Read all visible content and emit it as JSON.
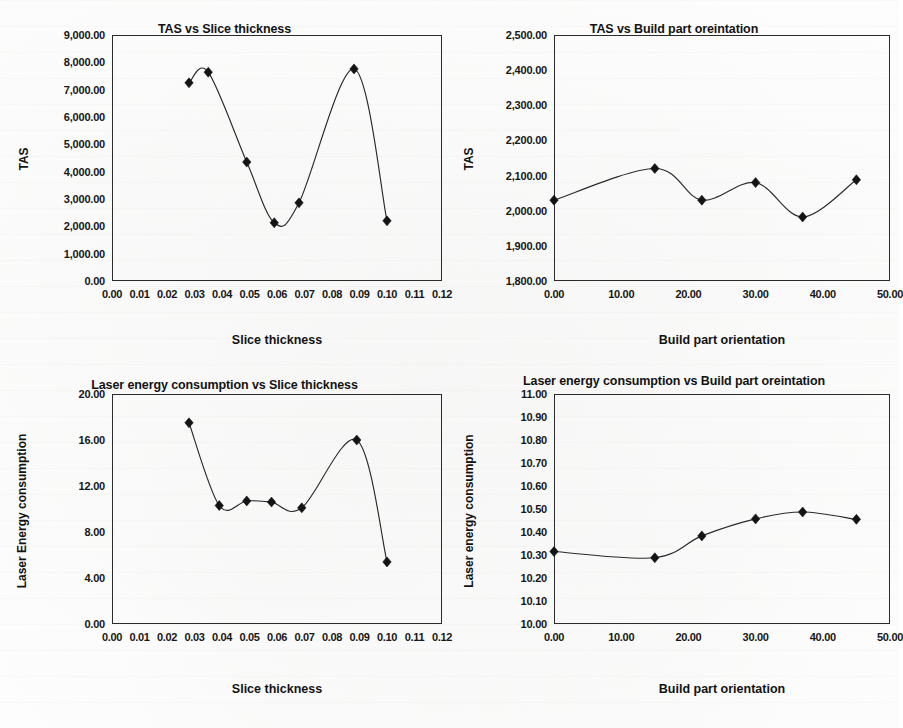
{
  "page": {
    "background_color": "#ffffff",
    "ink_color": "#1a1a1a"
  },
  "charts": [
    {
      "id": "tas-vs-slice-thickness",
      "title": "TAS vs Slice thickness",
      "xlabel": "Slice thickness",
      "ylabel": "TAS",
      "yticks": [
        "0.00",
        "1,000.00",
        "2,000.00",
        "3,000.00",
        "4,000.00",
        "5,000.00",
        "6,000.00",
        "7,000.00",
        "8,000.00",
        "9,000.00"
      ],
      "xticks": [
        "0.00",
        "0.01",
        "0.02",
        "0.03",
        "0.04",
        "0.05",
        "0.06",
        "0.07",
        "0.08",
        "0.09",
        "0.10",
        "0.11",
        "0.12"
      ]
    },
    {
      "id": "tas-vs-build-part-orientation",
      "title": "TAS vs Build part oreintation",
      "xlabel": "Build part orientation",
      "ylabel": "TAS",
      "yticks": [
        "1,800.00",
        "1,900.00",
        "2,000.00",
        "2,100.00",
        "2,200.00",
        "2,300.00",
        "2,400.00",
        "2,500.00"
      ],
      "xticks": [
        "0.00",
        "10.00",
        "20.00",
        "30.00",
        "40.00",
        "50.00"
      ]
    },
    {
      "id": "laser-energy-vs-slice-thickness",
      "title": "Laser energy consumption vs Slice thickness",
      "xlabel": "Slice thickness",
      "ylabel": "Laser Energy consumption",
      "yticks": [
        "0.00",
        "4.00",
        "8.00",
        "12.00",
        "16.00",
        "20.00"
      ],
      "xticks": [
        "0.00",
        "0.01",
        "0.02",
        "0.03",
        "0.04",
        "0.05",
        "0.06",
        "0.07",
        "0.08",
        "0.09",
        "0.10",
        "0.11",
        "0.12"
      ]
    },
    {
      "id": "laser-energy-vs-build-part-orientation",
      "title": "Laser energy consumption vs Build part oreintation",
      "xlabel": "Build part orientation",
      "ylabel": "Laser energy consumption",
      "yticks": [
        "10.00",
        "10.10",
        "10.20",
        "10.30",
        "10.40",
        "10.50",
        "10.60",
        "10.70",
        "10.80",
        "10.90",
        "11.00"
      ],
      "xticks": [
        "0.00",
        "10.00",
        "20.00",
        "30.00",
        "40.00",
        "50.00"
      ]
    }
  ],
  "chart_data": [
    {
      "type": "scatter",
      "title": "TAS vs Slice thickness",
      "xlabel": "Slice thickness",
      "ylabel": "TAS",
      "xlim": [
        0.0,
        0.12
      ],
      "ylim": [
        0.0,
        9000.0
      ],
      "xtick_step": 0.01,
      "ytick_step": 1000.0,
      "grid": false,
      "legend": "none",
      "marker": "diamond",
      "smooth_line": true,
      "x": [
        0.028,
        0.035,
        0.049,
        0.059,
        0.068,
        0.088,
        0.1
      ],
      "y": [
        7250,
        7640,
        4350,
        2130,
        2860,
        7760,
        2200
      ]
    },
    {
      "type": "scatter",
      "title": "TAS vs Build part oreintation",
      "xlabel": "Build part orientation",
      "ylabel": "TAS",
      "xlim": [
        0.0,
        50.0
      ],
      "ylim": [
        1800.0,
        2500.0
      ],
      "xtick_step": 10.0,
      "ytick_step": 100.0,
      "grid": false,
      "legend": "none",
      "marker": "diamond",
      "smooth_line": true,
      "x": [
        0.0,
        15.0,
        22.0,
        30.0,
        37.0,
        45.0
      ],
      "y": [
        2030,
        2120,
        2030,
        2080,
        1982,
        2088
      ]
    },
    {
      "type": "scatter",
      "title": "Laser energy consumption vs Slice thickness",
      "xlabel": "Slice thickness",
      "ylabel": "Laser Energy consumption",
      "xlim": [
        0.0,
        0.12
      ],
      "ylim": [
        0.0,
        20.0
      ],
      "xtick_step": 0.01,
      "ytick_step": 4.0,
      "grid": false,
      "legend": "none",
      "marker": "diamond",
      "smooth_line": true,
      "x": [
        0.028,
        0.039,
        0.049,
        0.058,
        0.069,
        0.089,
        0.1
      ],
      "y": [
        17.5,
        10.3,
        10.7,
        10.6,
        10.1,
        16.0,
        5.4
      ]
    },
    {
      "type": "scatter",
      "title": "Laser energy consumption vs Build part oreintation",
      "xlabel": "Build part orientation",
      "ylabel": "Laser energy consumption",
      "xlim": [
        0.0,
        50.0
      ],
      "ylim": [
        10.0,
        11.0
      ],
      "xtick_step": 10.0,
      "ytick_step": 0.1,
      "grid": false,
      "legend": "none",
      "marker": "diamond",
      "smooth_line": true,
      "x": [
        0.0,
        15.0,
        22.0,
        30.0,
        37.0,
        45.0
      ],
      "y": [
        10.315,
        10.288,
        10.383,
        10.457,
        10.487,
        10.455
      ]
    }
  ]
}
